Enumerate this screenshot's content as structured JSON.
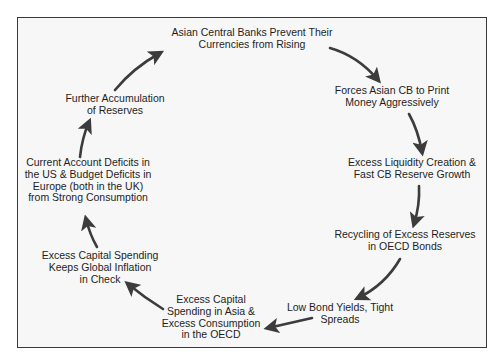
{
  "diagram": {
    "type": "cycle",
    "nodes": [
      {
        "id": "asian-cb-prevent",
        "lines": [
          "Asian Central Banks Prevent Their",
          "Currencies from Rising"
        ]
      },
      {
        "id": "forces-print",
        "lines": [
          "Forces Asian CB to Print",
          "Money Aggressively"
        ]
      },
      {
        "id": "excess-liquidity",
        "lines": [
          "Excess Liquidity Creation &",
          "Fast CB Reserve Growth"
        ]
      },
      {
        "id": "recycling-reserves",
        "lines": [
          "Recycling of Excess Reserves",
          "in OECD Bonds"
        ]
      },
      {
        "id": "low-yields",
        "lines": [
          "Low Bond Yields, Tight",
          "Spreads"
        ]
      },
      {
        "id": "excess-capex-consumption",
        "lines": [
          "Excess Capital",
          "Spending in Asia &",
          "Excess Consumption",
          "in the OECD"
        ]
      },
      {
        "id": "inflation-check",
        "lines": [
          "Excess Capital Spending",
          "Keeps Global Inflation",
          "in Check"
        ]
      },
      {
        "id": "deficits",
        "lines": [
          "Current Account Deficits in",
          "the US & Budget Deficits in",
          "Europe (both in the UK)",
          "from Strong Consumption"
        ]
      },
      {
        "id": "accumulation",
        "lines": [
          "Further Accumulation",
          "of Reserves"
        ]
      }
    ],
    "edges": [
      {
        "from": "asian-cb-prevent",
        "to": "forces-print"
      },
      {
        "from": "forces-print",
        "to": "excess-liquidity"
      },
      {
        "from": "excess-liquidity",
        "to": "recycling-reserves"
      },
      {
        "from": "recycling-reserves",
        "to": "low-yields"
      },
      {
        "from": "low-yields",
        "to": "excess-capex-consumption"
      },
      {
        "from": "excess-capex-consumption",
        "to": "inflation-check"
      },
      {
        "from": "inflation-check",
        "to": "deficits"
      },
      {
        "from": "deficits",
        "to": "accumulation"
      },
      {
        "from": "accumulation",
        "to": "asian-cb-prevent"
      }
    ],
    "colors": {
      "arrow": "#3c3c3c",
      "text": "#1e1e1e",
      "frame_border": "#3a3a3a",
      "frame_fill": "#f7f7f7"
    }
  }
}
